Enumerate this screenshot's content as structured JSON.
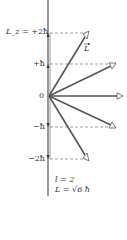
{
  "diagram": {
    "axis_label": "L_z",
    "levels": [
      {
        "m": 2,
        "label": "+2ħ",
        "axis_prefix": "L_z = ",
        "y": 33,
        "tip_x": 88
      },
      {
        "m": 1,
        "label": "+ħ",
        "y": 64,
        "tip_x": 115
      },
      {
        "m": 0,
        "label": "0",
        "y": 96,
        "tip_x": 122
      },
      {
        "m": -1,
        "label": "−ħ",
        "y": 127,
        "tip_x": 115
      },
      {
        "m": -2,
        "label": "−2ħ",
        "y": 159,
        "tip_x": 88
      }
    ],
    "vector_label": "L",
    "quantum_number": "l = 2",
    "magnitude": "L = √6 ħ",
    "colors": {
      "axis": "#333333",
      "vector": "#555555",
      "dash": "#777777"
    }
  }
}
